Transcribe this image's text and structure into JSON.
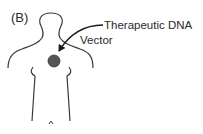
{
  "figure": {
    "panel_label": "(B)",
    "labels": {
      "therapeutic_dna": "Therapeutic DNA",
      "vector": "Vector"
    },
    "colors": {
      "outline": "#3a3a3a",
      "vector_fill": "#555555",
      "text": "#2a2a2a",
      "background": "#ffffff"
    }
  }
}
